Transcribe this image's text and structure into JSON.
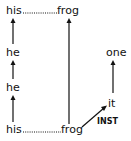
{
  "diagram": {
    "top_row": {
      "left": "his",
      "right": "frog"
    },
    "middle_left": [
      "he",
      "he"
    ],
    "bottom_row": {
      "left": "his",
      "right": "frog"
    },
    "right_column": {
      "top": "one",
      "bottom": "it"
    },
    "edge_label": "INST"
  }
}
